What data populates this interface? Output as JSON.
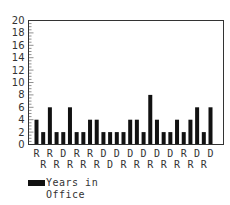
{
  "chart_data": {
    "type": "bar",
    "title": "",
    "xlabel": "",
    "ylabel": "",
    "ylim": [
      0,
      20
    ],
    "yticks": [
      0,
      2,
      4,
      6,
      8,
      10,
      12,
      14,
      16,
      18,
      20
    ],
    "grid": false,
    "legend_position": "bottom-left",
    "categories": [
      "R",
      "R",
      "R",
      "R",
      "D",
      "R",
      "R",
      "R",
      "R",
      "R",
      "D",
      "D",
      "D",
      "R",
      "D",
      "R",
      "D",
      "R",
      "D",
      "R",
      "D",
      "R",
      "R",
      "R",
      "D",
      "R",
      "D"
    ],
    "label_rows": {
      "top": [
        "R",
        "R",
        "D",
        "R",
        "R",
        "D",
        "D",
        "R",
        "D",
        "D",
        "D",
        "R",
        "D",
        "D"
      ],
      "bottom": [
        "R",
        "R",
        "R",
        "R",
        "R",
        "D",
        "R",
        "R",
        "R",
        "R",
        "R",
        "R",
        "R"
      ]
    },
    "series": [
      {
        "name": "Years in Office",
        "color": "#111111",
        "values": [
          4,
          2,
          6,
          2,
          2,
          6,
          2,
          2,
          4,
          4,
          2,
          2,
          2,
          2,
          4,
          4,
          2,
          8,
          4,
          2,
          2,
          4,
          2,
          4,
          6,
          2,
          6
        ]
      }
    ]
  },
  "legend": {
    "line1": "Years in",
    "line2": "Office"
  }
}
